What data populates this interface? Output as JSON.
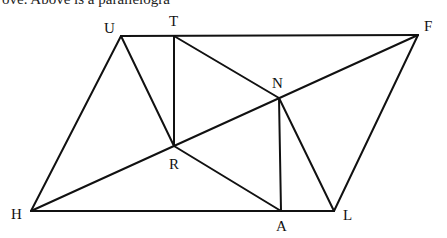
{
  "caption": "ove.     Above is a parallelogra",
  "diagram": {
    "type": "geometry",
    "points": {
      "U": {
        "x": 121,
        "y": 36,
        "lx": 104,
        "ly": 33
      },
      "T": {
        "x": 174,
        "y": 36,
        "lx": 169,
        "ly": 26
      },
      "F": {
        "x": 418,
        "y": 35,
        "lx": 424,
        "ly": 31
      },
      "N": {
        "x": 279,
        "y": 98,
        "lx": 272,
        "ly": 88
      },
      "R": {
        "x": 174,
        "y": 146,
        "lx": 169,
        "ly": 169
      },
      "H": {
        "x": 31,
        "y": 211,
        "lx": 11,
        "ly": 219
      },
      "A": {
        "x": 281,
        "y": 211,
        "lx": 276,
        "ly": 231
      },
      "L": {
        "x": 334,
        "y": 211,
        "lx": 343,
        "ly": 220
      }
    },
    "segments": [
      [
        "U",
        "F"
      ],
      [
        "U",
        "H"
      ],
      [
        "H",
        "L"
      ],
      [
        "L",
        "F"
      ],
      [
        "U",
        "R"
      ],
      [
        "T",
        "R"
      ],
      [
        "T",
        "N"
      ],
      [
        "H",
        "F"
      ],
      [
        "R",
        "A"
      ],
      [
        "N",
        "A"
      ],
      [
        "N",
        "L"
      ]
    ],
    "labels": [
      "U",
      "T",
      "F",
      "N",
      "R",
      "H",
      "A",
      "L"
    ]
  }
}
